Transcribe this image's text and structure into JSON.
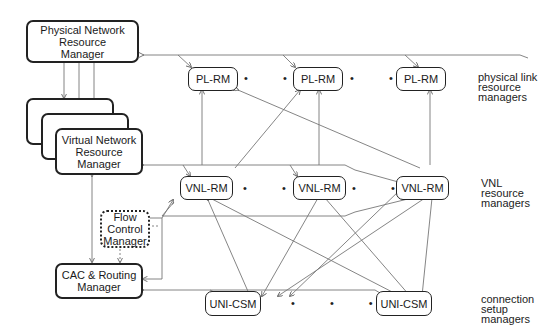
{
  "diagram": {
    "central": {
      "physical_manager": "Physical Network Resource Manager",
      "virtual_manager": "Virtual Network Resource Manager",
      "flow_control": "Flow Control Manager",
      "cac_routing": "CAC & Routing Manager"
    },
    "rows": {
      "pl": {
        "node": "PL-RM",
        "count_shown": 3,
        "legend": [
          "physical link",
          "resource",
          "managers"
        ]
      },
      "vnl": {
        "node": "VNL-RM",
        "count_shown": 3,
        "legend": [
          "VNL",
          "resource",
          "managers"
        ]
      },
      "uni": {
        "node": "UNI-CSM",
        "count_shown": 2,
        "legend": [
          "connection",
          "setup",
          "managers"
        ]
      }
    },
    "ellipsis": "• • •",
    "colors": {
      "line": "#777777",
      "border": "#222222",
      "background": "#ffffff"
    }
  }
}
